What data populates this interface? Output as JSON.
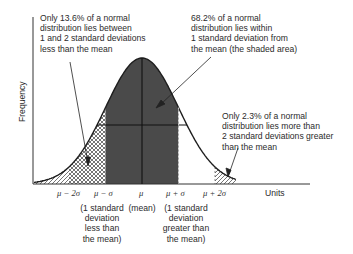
{
  "diagram": {
    "type": "normal-distribution",
    "axes": {
      "y_label": "Frequency",
      "x_label": "Units"
    },
    "ticks": [
      {
        "id": "m2s",
        "label": "μ − 2σ"
      },
      {
        "id": "m1s",
        "label": "μ − σ"
      },
      {
        "id": "mu",
        "label": "μ"
      },
      {
        "id": "p1s",
        "label": "μ + σ"
      },
      {
        "id": "p2s",
        "label": "μ + 2σ"
      }
    ],
    "tick_notes": {
      "m1s": "(1 standard\ndeviation\nless than\nthe mean)",
      "mu": "(mean)",
      "p1s": "(1 standard\ndeviation\ngreater than\nthe mean)"
    },
    "annotations": {
      "left_tail": "Only 13.6% of a normal\ndistribution lies between\n1 and 2 standard deviations\nless than the mean",
      "center": "68.2% of a normal\ndistribution lies within\n1 standard deviation from\nthe mean (the shaded area)",
      "right_tail": "Only 2.3% of a normal\ndistribution lies more than\n2 standard deviations greater\nthan the mean"
    },
    "regions": [
      {
        "name": "within 1 sd",
        "range": "μ−σ to μ+σ",
        "percent": 68.2,
        "fill": "dark shaded"
      },
      {
        "name": "1 to 2 sd below mean",
        "range": "μ−2σ to μ−σ",
        "percent": 13.6,
        "fill": "crosshatch"
      },
      {
        "name": "beyond 2 sd below mean",
        "range": "< μ−2σ",
        "fill": "diagonal hatch"
      },
      {
        "name": "beyond 2 sd above mean",
        "range": "> μ+2σ",
        "percent": 2.3,
        "fill": "diagonal hatch"
      }
    ],
    "colors": {
      "shade": "#4a4a4a",
      "line": "#1e1e1e",
      "text": "#2b2b2b"
    }
  }
}
